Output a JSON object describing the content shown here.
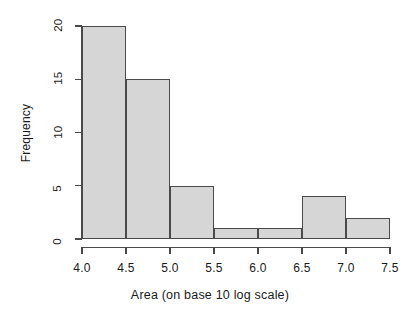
{
  "chart_data": {
    "type": "bar",
    "title": "",
    "xlabel": "Area (on base 10 log scale)",
    "ylabel": "Frequency",
    "grid": false,
    "legend": null,
    "xlim": [
      4.0,
      7.5
    ],
    "ylim": [
      0,
      20
    ],
    "bin_width": 0.5,
    "bin_edges": [
      4.0,
      4.5,
      5.0,
      5.5,
      6.0,
      6.5,
      7.0,
      7.5
    ],
    "categories": [
      "4.0-4.5",
      "4.5-5.0",
      "5.0-5.5",
      "5.5-6.0",
      "6.0-6.5",
      "6.5-7.0",
      "7.0-7.5"
    ],
    "values": [
      20,
      15,
      5,
      1,
      1,
      4,
      2
    ],
    "xticks": [
      "4.0",
      "4.5",
      "5.0",
      "5.5",
      "6.0",
      "6.5",
      "7.0",
      "7.5"
    ],
    "xtick_values": [
      4.0,
      4.5,
      5.0,
      5.5,
      6.0,
      6.5,
      7.0,
      7.5
    ],
    "yticks": [
      "0",
      "5",
      "10",
      "15",
      "20"
    ],
    "ytick_values": [
      0,
      5,
      10,
      15,
      20
    ],
    "bar_fill_color": "#d6d6d6",
    "bar_border_color": "#4a4a4a",
    "axis_color": "#4a4a4a",
    "background_color": "#ffffff"
  }
}
